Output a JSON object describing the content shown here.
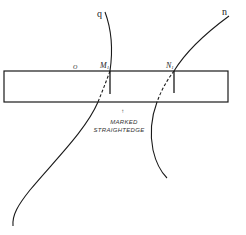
{
  "diagram": {
    "curves": [
      {
        "id": "q",
        "label": "q"
      },
      {
        "id": "n",
        "label": "n"
      }
    ],
    "points": [
      {
        "id": "M1",
        "label": "M",
        "subscript": "1"
      },
      {
        "id": "N1",
        "label": "N",
        "subscript": "1"
      }
    ],
    "origin_label": "O",
    "straightedge": {
      "caption_arrow": "↑",
      "caption_line1": "MARKED",
      "caption_line2": "STRAIGHTEDGE"
    },
    "colors": {
      "stroke": "#1a1a1a",
      "background": "#ffffff"
    }
  }
}
